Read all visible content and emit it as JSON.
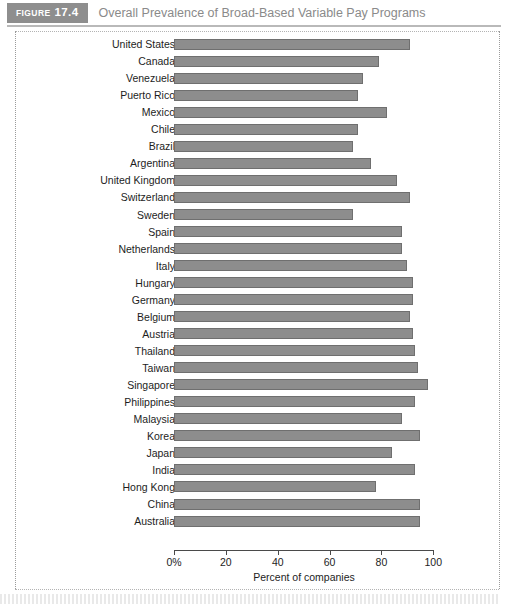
{
  "header": {
    "figure_word": "FIGURE",
    "figure_number": "17.4",
    "title": "Overall Prevalence of Broad-Based Variable Pay Programs",
    "tag_bg": "#8e8e8e",
    "title_color": "#8a8a8a"
  },
  "chart_data": {
    "type": "bar",
    "orientation": "horizontal",
    "title": "Overall Prevalence of Broad-Based Variable Pay Programs",
    "xlabel": "Percent of companies",
    "ylabel": "",
    "xlim": [
      0,
      100
    ],
    "xticks": [
      0,
      20,
      40,
      60,
      80,
      100
    ],
    "xtick_labels": [
      "0%",
      "20",
      "40",
      "60",
      "80",
      "100"
    ],
    "grid": false,
    "legend": null,
    "bar_color": "#8d8d8d",
    "bar_edge_color": "#6f6f6f",
    "categories": [
      "United States",
      "Canada",
      "Venezuela",
      "Puerto Rico",
      "Mexico",
      "Chile",
      "Brazil",
      "Argentina",
      "United Kingdom",
      "Switzerland",
      "Sweden",
      "Spain",
      "Netherlands",
      "Italy",
      "Hungary",
      "Germany",
      "Belgium",
      "Austria",
      "Thailand",
      "Taiwan",
      "Singapore",
      "Philippines",
      "Malaysia",
      "Korea",
      "Japan",
      "India",
      "Hong Kong",
      "China",
      "Australia"
    ],
    "values": [
      91,
      79,
      73,
      71,
      82,
      71,
      69,
      76,
      86,
      91,
      69,
      88,
      88,
      90,
      92,
      92,
      91,
      92,
      93,
      94,
      98,
      93,
      88,
      95,
      84,
      93,
      78,
      95,
      95
    ]
  },
  "axis": {
    "x_title": "Percent of companies"
  }
}
